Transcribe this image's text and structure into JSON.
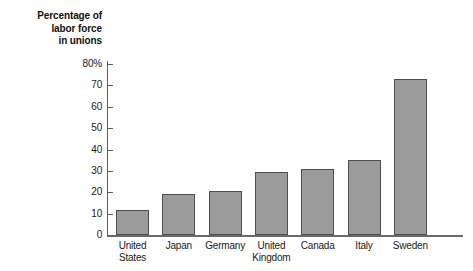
{
  "chart_data": {
    "type": "bar",
    "title": "",
    "xlabel": "",
    "ylabel": "Percentage of labor force in unions",
    "ylabel_lines": [
      "Percentage of",
      "labor force",
      "in unions"
    ],
    "categories": [
      "United States",
      "Japan",
      "Germany",
      "United Kingdom",
      "Canada",
      "Italy",
      "Sweden"
    ],
    "category_lines": [
      [
        "United",
        "States"
      ],
      [
        "Japan"
      ],
      [
        "Germany"
      ],
      [
        "United",
        "Kingdom"
      ],
      [
        "Canada"
      ],
      [
        "Italy"
      ],
      [
        "Sweden"
      ]
    ],
    "values": [
      11.5,
      19,
      20.5,
      29.5,
      31,
      35,
      73
    ],
    "ylim": [
      0,
      80
    ],
    "ytick_values": [
      0,
      10,
      20,
      30,
      40,
      50,
      60,
      70,
      80
    ],
    "ytick_labels": [
      "0",
      "10",
      "20",
      "30",
      "40",
      "50",
      "60",
      "70",
      "80%"
    ],
    "grid": false,
    "legend": false,
    "bar_fill_color": "#9b9b9b",
    "bar_border_color": "#4f4f4f",
    "axis_color": "#5d5d5d",
    "background_color": "#fefefe"
  }
}
